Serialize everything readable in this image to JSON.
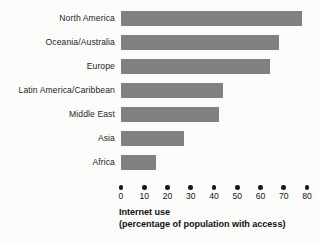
{
  "chart_data": {
    "type": "bar",
    "orientation": "horizontal",
    "title": "",
    "xlabel": "Internet use (percentage of population with access)",
    "ylabel": "",
    "categories": [
      "North America",
      "Oceania/Australia",
      "Europe",
      "Latin America/Caribbean",
      "Middle East",
      "Asia",
      "Africa"
    ],
    "values": [
      78,
      68,
      64,
      44,
      42,
      27,
      15
    ],
    "xlim": [
      0,
      80
    ],
    "xticks": [
      0,
      10,
      20,
      30,
      40,
      50,
      60,
      70,
      80
    ],
    "tick_labels": [
      "0",
      "10",
      "20",
      "30",
      "40",
      "50",
      "60",
      "70",
      "80"
    ],
    "grid": false,
    "legend": "none",
    "bar_color": "#808080",
    "background_color": "#fbfbfa"
  },
  "caption": {
    "line1": "Internet use",
    "line2": "(percentage of population with access)"
  }
}
